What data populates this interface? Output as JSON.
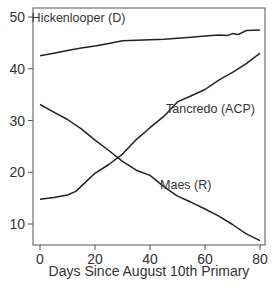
{
  "chart_data": {
    "type": "line",
    "title": "",
    "xlabel": "Days Since August 10th Primary",
    "ylabel": "",
    "xlim": [
      -1.5,
      82
    ],
    "ylim": [
      6,
      52.5
    ],
    "xticks": [
      0,
      20,
      40,
      60,
      80
    ],
    "yticks": [
      10,
      20,
      30,
      40,
      50
    ],
    "grid": false,
    "legend": "none (direct labels on lines)",
    "series": [
      {
        "name": "Hickenlooper (D)",
        "x": [
          0,
          5,
          10,
          15,
          20,
          25,
          30,
          35,
          40,
          45,
          50,
          55,
          60,
          65,
          68,
          70,
          72,
          75,
          80
        ],
        "values": [
          42.5,
          43.0,
          43.5,
          44.0,
          44.4,
          44.9,
          45.4,
          45.5,
          45.6,
          45.7,
          45.9,
          46.1,
          46.3,
          46.5,
          46.4,
          46.8,
          46.6,
          47.4,
          47.5
        ],
        "label_pos": [
          14,
          49
        ]
      },
      {
        "name": "Tancredo (ACP)",
        "x": [
          0,
          5,
          10,
          13,
          16,
          20,
          25,
          30,
          35,
          40,
          45,
          50,
          55,
          60,
          65,
          70,
          75,
          80
        ],
        "values": [
          14.8,
          15.1,
          15.6,
          16.3,
          17.8,
          19.8,
          21.5,
          23.5,
          26.3,
          28.6,
          30.8,
          33.6,
          34.8,
          36.0,
          37.8,
          39.3,
          41.0,
          43.0
        ],
        "label_pos": [
          62,
          31.5
        ]
      },
      {
        "name": "Maes (R)",
        "x": [
          0,
          5,
          10,
          15,
          20,
          25,
          30,
          35,
          40,
          45,
          50,
          55,
          60,
          65,
          70,
          75,
          80
        ],
        "values": [
          33.1,
          31.6,
          30.2,
          28.4,
          26.2,
          24.2,
          22.1,
          20.4,
          19.4,
          17.2,
          15.4,
          14.2,
          12.9,
          11.5,
          9.9,
          8.1,
          6.8
        ],
        "label_pos": [
          53,
          16.8
        ]
      }
    ]
  },
  "axes": {
    "y_tick_labels": [
      "10",
      "20",
      "30",
      "40",
      "50"
    ],
    "x_tick_labels": [
      "0",
      "20",
      "40",
      "60",
      "80"
    ],
    "x_title": "Days Since August 10th Primary"
  },
  "labels": {
    "hickenlooper": "Hickenlooper (D)",
    "tancredo": "Tancredo (ACP)",
    "maes": "Maes (R)"
  },
  "colors": {
    "line": "#222222",
    "frame": "#555555",
    "text": "#333333"
  }
}
